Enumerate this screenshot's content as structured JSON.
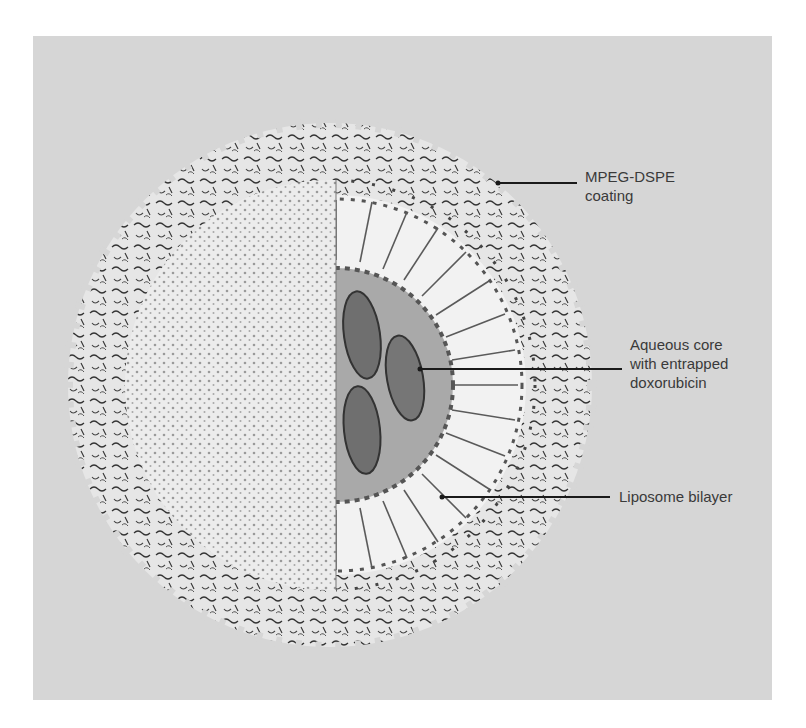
{
  "figure": {
    "labels": [
      {
        "id": "mpeg",
        "lines": [
          "MPEG-DSPE",
          "coating"
        ]
      },
      {
        "id": "core",
        "lines": [
          "Aqueous core",
          "with entrapped",
          "doxorubicin"
        ]
      },
      {
        "id": "bilayer",
        "lines": [
          "Liposome bilayer"
        ]
      }
    ]
  },
  "colors": {
    "background": "#d6d6d6",
    "sphere_fill": "#ececec",
    "core_fill": "#a9a9a9",
    "drug_fill": "#6f6f6f",
    "line": "#1a1a1a",
    "text": "#3a3a3a"
  }
}
